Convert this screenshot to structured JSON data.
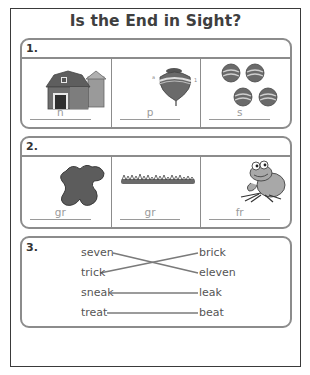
{
  "title": "Is the End in Sight?",
  "sections": [
    {
      "number": "1.",
      "items": [
        {
          "picture": "barn",
          "answer": "n"
        },
        {
          "picture": "top",
          "answer": "p"
        },
        {
          "picture": "balls",
          "answer": "s"
        }
      ]
    },
    {
      "number": "2.",
      "items": [
        {
          "picture": "blob",
          "answer": "gr"
        },
        {
          "picture": "grass",
          "answer": "gr"
        },
        {
          "picture": "frog",
          "answer": "fr"
        }
      ]
    },
    {
      "number": "3.",
      "left_words": [
        "seven",
        "trick",
        "sneak",
        "treat"
      ],
      "right_words": [
        "brick",
        "eleven",
        "leak",
        "beat"
      ],
      "matches": [
        {
          "left": "seven",
          "right": "eleven"
        },
        {
          "left": "trick",
          "right": "brick"
        },
        {
          "left": "sneak",
          "right": "leak"
        },
        {
          "left": "treat",
          "right": "beat"
        }
      ]
    }
  ],
  "colors": {
    "frame": "#3a3a3a",
    "section_border": "#8c8c8c",
    "answer_text": "#9a9a9a",
    "match_line": "#7a7a7a"
  }
}
